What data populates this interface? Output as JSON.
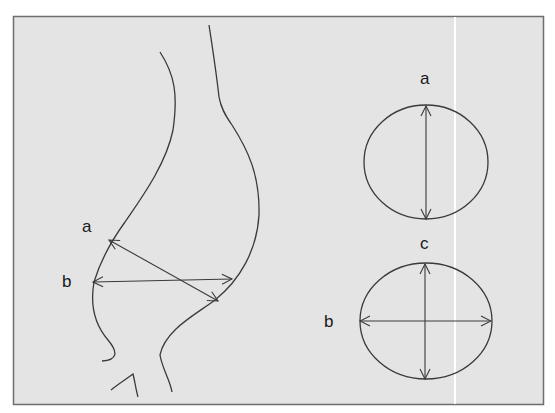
{
  "figure": {
    "background": "#e4e4e4",
    "frame_color": "#6e6e6e",
    "stroke_color": "#3a3a3a",
    "divider_color": "#ffffff"
  },
  "labels": {
    "side_view": {
      "a": "a",
      "b": "b"
    },
    "cross_section_top": {
      "a": "a"
    },
    "cross_section_bottom": {
      "c": "c",
      "b": "b"
    }
  }
}
